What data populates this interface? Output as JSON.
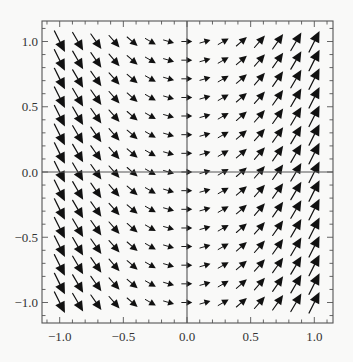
{
  "chart_data": {
    "type": "vector_field",
    "title": "",
    "xlabel": "",
    "ylabel": "",
    "field": {
      "vx": "1",
      "vy": "2*x",
      "description": "Slope field independent of y; arrows point down-right for x<0, right at x=0, up-right for x>0; arrow length grows with |x|"
    },
    "xlim": [
      -1.14,
      1.14
    ],
    "ylim": [
      -1.14,
      1.14
    ],
    "grid_x": [
      -1.0,
      -0.857,
      -0.714,
      -0.571,
      -0.429,
      -0.286,
      -0.143,
      0.0,
      0.143,
      0.286,
      0.429,
      0.571,
      0.714,
      0.857,
      1.0
    ],
    "grid_y": [
      -1.0,
      -0.857,
      -0.714,
      -0.571,
      -0.429,
      -0.286,
      -0.143,
      0.0,
      0.143,
      0.286,
      0.429,
      0.571,
      0.714,
      0.857,
      1.0
    ],
    "x_ticks": [
      -1.0,
      -0.5,
      0.0,
      0.5,
      1.0
    ],
    "x_tick_labels": [
      "−1.0",
      "−0.5",
      "0.0",
      "0.5",
      "1.0"
    ],
    "y_ticks": [
      -1.0,
      -0.5,
      0.0,
      0.5,
      1.0
    ],
    "y_tick_labels": [
      "−1.0",
      "−0.5",
      "0.0",
      "0.5",
      "1.0"
    ],
    "minor_tick_step": 0.1,
    "axes_through_origin": true,
    "grid": false,
    "legend": null,
    "arrow_color": "#111111",
    "frame_color": "#555555",
    "background": "#f9f9f8"
  },
  "layout": {
    "frame": {
      "left": 42,
      "top": 21,
      "right": 333,
      "bottom": 323
    },
    "origin_px": {
      "x": 187,
      "y": 172
    },
    "px_per_unit_x": 127.3,
    "px_per_unit_y": 130.5
  }
}
